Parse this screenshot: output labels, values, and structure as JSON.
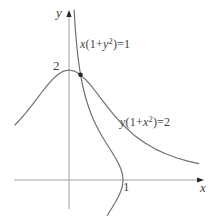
{
  "colors": {
    "background": "#ffffff",
    "curve": "#707070",
    "axis": "#a2a2a2",
    "marker": "#262626",
    "text": "#3f3f3f"
  },
  "chart_data": {
    "type": "line",
    "title": "",
    "grid": false,
    "legend": "inline-curve-labels",
    "axes": {
      "x_label": "x",
      "y_label": "y",
      "x_ticks": [
        {
          "value": 1,
          "label": "1"
        }
      ],
      "y_ticks": [
        {
          "value": 2,
          "label": "2"
        }
      ],
      "x_range": [
        -1.02,
        2.5
      ],
      "y_range": [
        -0.53,
        3.09
      ]
    },
    "series": [
      {
        "name": "curve-x-of-y",
        "equation": "x(1+y^2)=1",
        "label_text": "x(1+y²)=1",
        "label_parts": {
          "v1": "x",
          "m1": "(1+",
          "v2": "y",
          "sup": "2",
          "m2": ")=1"
        },
        "points": [
          [
            0.095,
            3.09
          ],
          [
            0.113,
            2.8
          ],
          [
            0.129,
            2.6
          ],
          [
            0.148,
            2.4
          ],
          [
            0.171,
            2.2
          ],
          [
            0.2,
            2.0
          ],
          [
            0.217,
            1.9
          ],
          [
            0.236,
            1.8
          ],
          [
            0.257,
            1.7
          ],
          [
            0.281,
            1.6
          ],
          [
            0.308,
            1.5
          ],
          [
            0.338,
            1.4
          ],
          [
            0.372,
            1.3
          ],
          [
            0.41,
            1.2
          ],
          [
            0.452,
            1.1
          ],
          [
            0.5,
            1.0
          ],
          [
            0.552,
            0.9
          ],
          [
            0.61,
            0.8
          ],
          [
            0.671,
            0.7
          ],
          [
            0.735,
            0.6
          ],
          [
            0.8,
            0.5
          ],
          [
            0.862,
            0.4
          ],
          [
            0.917,
            0.3
          ],
          [
            0.962,
            0.2
          ],
          [
            0.99,
            0.1
          ],
          [
            1.0,
            0.0
          ],
          [
            0.99,
            -0.1
          ],
          [
            0.962,
            -0.2
          ],
          [
            0.917,
            -0.3
          ],
          [
            0.862,
            -0.4
          ],
          [
            0.8,
            -0.5
          ],
          [
            0.735,
            -0.6
          ],
          [
            0.709,
            -0.64
          ]
        ]
      },
      {
        "name": "curve-y-of-x",
        "equation": "y(1+x^2)=2",
        "label_text": "y(1+x²)=2",
        "label_parts": {
          "v1": "y",
          "m1": "(1+",
          "v2": "x",
          "sup": "2",
          "m2": ")=2"
        },
        "points": [
          [
            -1.0,
            1.0
          ],
          [
            -0.9,
            1.105
          ],
          [
            -0.8,
            1.22
          ],
          [
            -0.7,
            1.342
          ],
          [
            -0.6,
            1.471
          ],
          [
            -0.5,
            1.6
          ],
          [
            -0.4,
            1.724
          ],
          [
            -0.3,
            1.835
          ],
          [
            -0.2,
            1.923
          ],
          [
            -0.1,
            1.98
          ],
          [
            0,
            2.0
          ],
          [
            0.1,
            1.98
          ],
          [
            0.2,
            1.923
          ],
          [
            0.3,
            1.835
          ],
          [
            0.4,
            1.724
          ],
          [
            0.5,
            1.6
          ],
          [
            0.6,
            1.471
          ],
          [
            0.7,
            1.342
          ],
          [
            0.8,
            1.22
          ],
          [
            0.9,
            1.105
          ],
          [
            1.0,
            1.0
          ],
          [
            1.2,
            0.82
          ],
          [
            1.4,
            0.676
          ],
          [
            1.6,
            0.562
          ],
          [
            1.8,
            0.472
          ],
          [
            2.0,
            0.4
          ],
          [
            2.2,
            0.342
          ],
          [
            2.4,
            0.296
          ]
        ]
      }
    ],
    "intersection": {
      "x": 0.213,
      "y": 1.915,
      "marked": true
    }
  }
}
